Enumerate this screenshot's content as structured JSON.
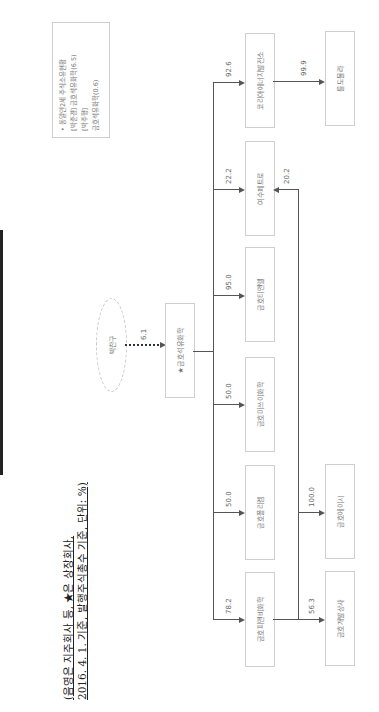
{
  "header": {
    "line1": "(음영은 지주회사 등, ★은 상장회사,",
    "line2": "2016. 4. 1. 기준, 발행주식총수 기준, 단위: %)"
  },
  "owner": {
    "name": "박찬구",
    "stake": "6.1"
  },
  "parent": {
    "name": "★금호석유화학"
  },
  "subsidiaries": [
    {
      "name": "금호피앤비화학",
      "stake": "78.2"
    },
    {
      "name": "금호폴리켐",
      "stake": "50.0"
    },
    {
      "name": "금호미쓰이화학",
      "stake": "50.0"
    },
    {
      "name": "금호티앤엘",
      "stake": "95.0"
    },
    {
      "name": "여수페트로",
      "stake": "22.2"
    },
    {
      "name": "코리아에너지발전소",
      "stake": "92.6"
    }
  ],
  "second_tier": [
    {
      "name": "금호개발상사",
      "stake": "56.3",
      "from": "금호피앤비화학"
    },
    {
      "name": "금호에이시",
      "stake": "100.0",
      "from": "금호피앤비화학"
    },
    {
      "name": "여수페트로",
      "stake": "20.2",
      "from": "금호피앤비화학"
    },
    {
      "name": "를도물라",
      "stake": "99.9",
      "from": "코리아에너지발전소"
    }
  ],
  "note": {
    "title": "• 동일인2세 주식소유현황",
    "lines": [
      "[박준경] 금호석유화학(6.5)",
      "[박주형]",
      "금호석유화학(0.6)"
    ]
  }
}
